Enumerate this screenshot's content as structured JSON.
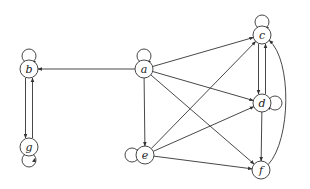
{
  "diagram": {
    "type": "directed-graph",
    "style": {
      "stroke": "#333333",
      "node_fill": "#ffffff",
      "background": "#ffffff"
    },
    "nodes": [
      {
        "id": "a",
        "label": "a",
        "x": 144,
        "y": 69
      },
      {
        "id": "b",
        "label": "b",
        "x": 29,
        "y": 69
      },
      {
        "id": "g",
        "label": "g",
        "x": 29,
        "y": 147
      },
      {
        "id": "e",
        "label": "e",
        "x": 145,
        "y": 155
      },
      {
        "id": "c",
        "label": "c",
        "x": 262,
        "y": 35
      },
      {
        "id": "d",
        "label": "d",
        "x": 262,
        "y": 103
      },
      {
        "id": "f",
        "label": "f",
        "x": 261,
        "y": 170
      }
    ],
    "edges": [
      {
        "from": "a",
        "to": "a",
        "kind": "self-loop",
        "side": "top"
      },
      {
        "from": "b",
        "to": "b",
        "kind": "self-loop",
        "side": "top"
      },
      {
        "from": "g",
        "to": "g",
        "kind": "self-loop",
        "side": "bottom"
      },
      {
        "from": "e",
        "to": "e",
        "kind": "self-loop",
        "side": "left"
      },
      {
        "from": "c",
        "to": "c",
        "kind": "self-loop",
        "side": "top"
      },
      {
        "from": "d",
        "to": "d",
        "kind": "self-loop",
        "side": "right"
      },
      {
        "from": "a",
        "to": "b"
      },
      {
        "from": "a",
        "to": "e"
      },
      {
        "from": "a",
        "to": "c"
      },
      {
        "from": "a",
        "to": "d"
      },
      {
        "from": "a",
        "to": "f"
      },
      {
        "from": "b",
        "to": "g"
      },
      {
        "from": "g",
        "to": "b"
      },
      {
        "from": "e",
        "to": "c"
      },
      {
        "from": "e",
        "to": "d"
      },
      {
        "from": "e",
        "to": "f"
      },
      {
        "from": "c",
        "to": "d"
      },
      {
        "from": "d",
        "to": "c"
      },
      {
        "from": "d",
        "to": "f"
      },
      {
        "from": "f",
        "to": "c",
        "kind": "curved-right"
      }
    ]
  }
}
